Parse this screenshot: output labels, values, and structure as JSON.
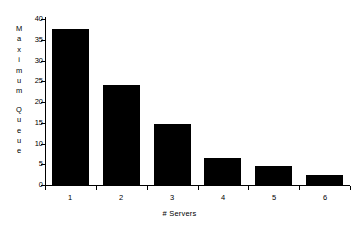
{
  "chart_data": {
    "type": "bar",
    "title": "",
    "xlabel": "# Servers",
    "ylabel": "Maximum Queue",
    "categories": [
      "1",
      "2",
      "3",
      "4",
      "5",
      "6"
    ],
    "values": [
      37.5,
      24.0,
      14.7,
      6.6,
      4.5,
      2.3
    ],
    "series": [
      {
        "name": "Maximum Queue",
        "values": [
          37.5,
          24.0,
          14.7,
          6.6,
          4.5,
          2.3
        ]
      }
    ],
    "ylim": [
      0,
      40
    ],
    "ytick_labels": [
      "0",
      "5",
      "10",
      "15",
      "20",
      "25",
      "30",
      "35",
      "40"
    ],
    "ytick_values": [
      0,
      5,
      10,
      15,
      20,
      25,
      30,
      35,
      40
    ],
    "xtick_labels": [
      "1",
      "2",
      "3",
      "4",
      "5",
      "6"
    ],
    "grid": false,
    "legend": false,
    "legend_position": "none",
    "bar_color": "#000000",
    "background_color": "#ffffff",
    "axis_color": "#000000"
  },
  "ylabel_letters": [
    "M",
    "a",
    "x",
    "i",
    "m",
    "u",
    "m",
    "",
    "Q",
    "u",
    "e",
    "u",
    "e"
  ],
  "caption": {
    "sliver_text": ""
  }
}
